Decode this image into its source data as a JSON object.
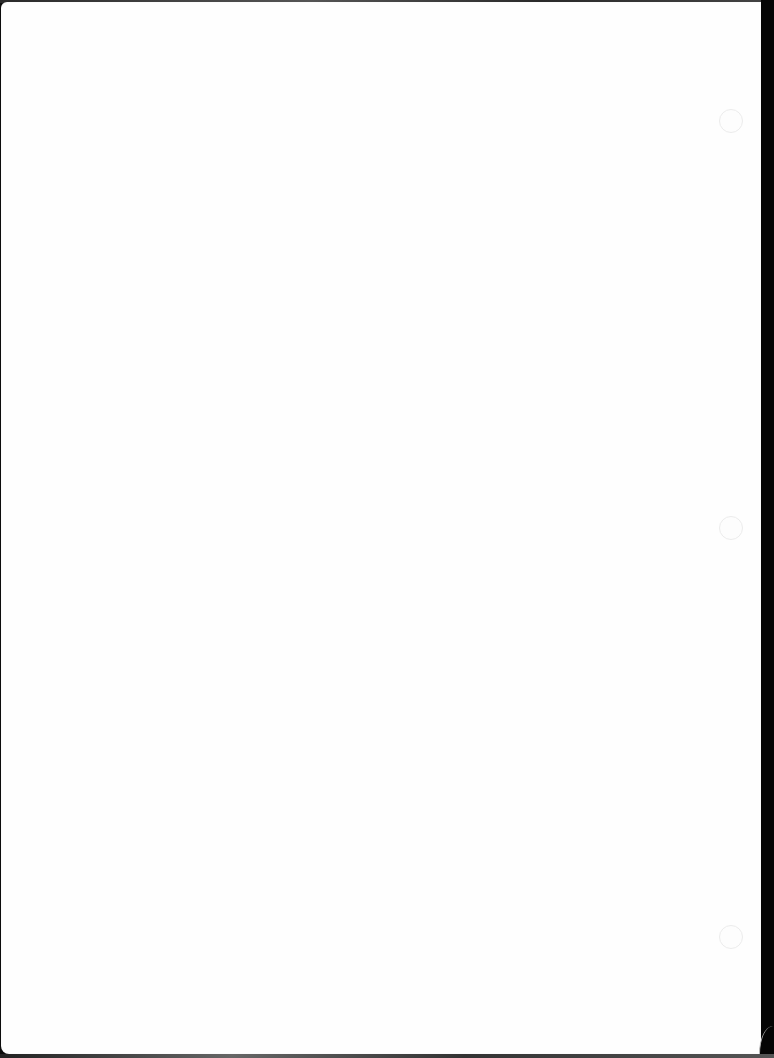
{
  "document": {
    "type": "scanned-page",
    "content": "",
    "background_color": "#fefefe",
    "edge_color": "#0c0c0c"
  },
  "punch_holes": [
    {
      "x": 719,
      "y": 109
    },
    {
      "x": 719,
      "y": 516
    },
    {
      "x": 719,
      "y": 925
    }
  ]
}
